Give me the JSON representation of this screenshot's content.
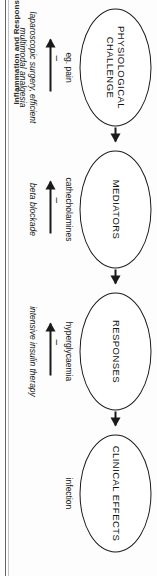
{
  "page": {
    "running_head": "Inflammation and Responses"
  },
  "figure": {
    "type": "flow-diagram",
    "orientation": "rotated-90",
    "nodes": [
      {
        "id": "physiological-challenge",
        "label": "PHYSIOLOGICAL CHALLENGE",
        "descriptor": "eg. pain"
      },
      {
        "id": "mediators",
        "label": "MEDIATORS",
        "descriptor": "cathecholamines"
      },
      {
        "id": "responses",
        "label": "RESPONSES",
        "descriptor": "hyperglycaemia"
      },
      {
        "id": "clinical-effects",
        "label": "CLINICAL EFFECTS",
        "descriptor": "infection"
      }
    ],
    "chain_arrows": [
      {
        "from": "physiological-challenge",
        "to": "mediators"
      },
      {
        "from": "mediators",
        "to": "responses"
      },
      {
        "from": "responses",
        "to": "clinical-effects"
      }
    ],
    "interventions": [
      {
        "target": "physiological-challenge",
        "sign": "–",
        "caption": "laparoscopic surgery, efficient multimodal analgesia"
      },
      {
        "target": "mediators",
        "sign": "–",
        "caption": "beta blockade"
      },
      {
        "target": "responses",
        "sign": "–",
        "caption": "intensive insulin therapy"
      }
    ],
    "colors": {
      "stroke": "#1a1a1a",
      "text": "#111111",
      "background": "#ffffff",
      "gutter_rule": "#4a4a4a"
    }
  }
}
